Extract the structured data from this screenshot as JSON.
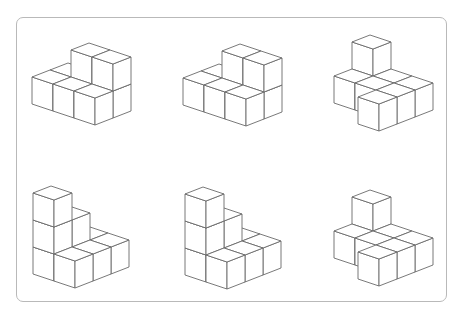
{
  "diagram": {
    "type": "isometric-cube-structures",
    "layout": {
      "rows": 2,
      "cols": 3
    },
    "colors": {
      "stroke": "#6a6a6a",
      "face": "#ffffff",
      "frame": "#b9b9b9",
      "background": "#ffffff"
    },
    "projection": {
      "a": [
        21,
        7
      ],
      "b": [
        18,
        -7
      ],
      "h": 27
    },
    "figures": [
      {
        "id": "figure-1",
        "origin": [
          32,
          104
        ],
        "cubes": [
          [
            0,
            0,
            0
          ],
          [
            1,
            0,
            0
          ],
          [
            2,
            0,
            0
          ],
          [
            0,
            1,
            0
          ],
          [
            1,
            1,
            0
          ],
          [
            2,
            1,
            0
          ],
          [
            1,
            1,
            1
          ],
          [
            2,
            1,
            1
          ]
        ]
      },
      {
        "id": "figure-2",
        "origin": [
          183,
          105
        ],
        "cubes": [
          [
            0,
            0,
            0
          ],
          [
            1,
            0,
            0
          ],
          [
            2,
            0,
            0
          ],
          [
            0,
            1,
            0
          ],
          [
            1,
            1,
            0
          ],
          [
            2,
            1,
            0
          ],
          [
            1,
            1,
            1
          ],
          [
            2,
            1,
            1
          ]
        ]
      },
      {
        "id": "figure-3",
        "origin": [
          334,
          103
        ],
        "cubes": [
          [
            0,
            0,
            0
          ],
          [
            0,
            1,
            0
          ],
          [
            1,
            0,
            0
          ],
          [
            1,
            1,
            0
          ],
          [
            2,
            -1,
            0
          ],
          [
            2,
            0,
            0
          ],
          [
            2,
            1,
            0
          ],
          [
            0,
            1,
            1
          ]
        ]
      },
      {
        "id": "figure-4",
        "origin": [
          33,
          274
        ],
        "cubes": [
          [
            0,
            0,
            0
          ],
          [
            0,
            0,
            1
          ],
          [
            0,
            0,
            2
          ],
          [
            0,
            1,
            0
          ],
          [
            0,
            1,
            1
          ],
          [
            0,
            2,
            0
          ],
          [
            1,
            0,
            0
          ],
          [
            1,
            1,
            0
          ],
          [
            1,
            2,
            0
          ]
        ]
      },
      {
        "id": "figure-5",
        "origin": [
          185,
          275
        ],
        "cubes": [
          [
            0,
            0,
            0
          ],
          [
            0,
            0,
            1
          ],
          [
            0,
            0,
            2
          ],
          [
            0,
            1,
            0
          ],
          [
            0,
            1,
            1
          ],
          [
            0,
            2,
            0
          ],
          [
            1,
            0,
            0
          ],
          [
            1,
            1,
            0
          ],
          [
            1,
            2,
            0
          ]
        ]
      },
      {
        "id": "figure-6",
        "origin": [
          334,
          258
        ],
        "cubes": [
          [
            0,
            0,
            0
          ],
          [
            0,
            1,
            0
          ],
          [
            1,
            0,
            0
          ],
          [
            1,
            1,
            0
          ],
          [
            2,
            -1,
            0
          ],
          [
            2,
            0,
            0
          ],
          [
            2,
            1,
            0
          ],
          [
            0,
            1,
            1
          ]
        ]
      }
    ]
  }
}
